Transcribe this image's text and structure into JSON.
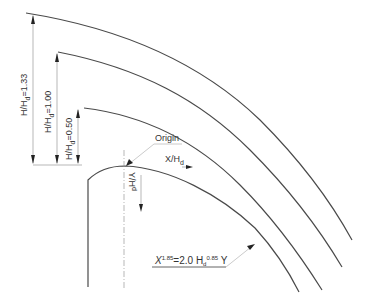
{
  "diagram": {
    "type": "spillway-crest-profile",
    "labels": {
      "origin": "Origin",
      "x_axis": "X/H",
      "x_axis_sub": "d",
      "y_axis": "Y/H",
      "y_axis_sub": "d"
    },
    "head_ratios": [
      {
        "prefix": "H/H",
        "sub": "d",
        "value": "=1.33"
      },
      {
        "prefix": "H/H",
        "sub": "d",
        "value": "=1.00"
      },
      {
        "prefix": "H/H",
        "sub": "d",
        "value": "=0.50"
      }
    ],
    "equation": {
      "lhs": "X",
      "lhs_exp": "1.85",
      "mid": "=2.0 H",
      "mid_sub": "d",
      "mid_exp": "0.85",
      "rhs": " Y"
    },
    "colors": {
      "curve": "#4a4a4a",
      "dimension": "#9a9a9a",
      "text": "#333333"
    }
  }
}
